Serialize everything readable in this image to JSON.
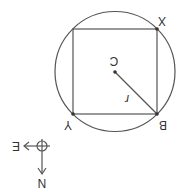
{
  "diagram": {
    "orientation": "rotated-180",
    "circle": {
      "cx": 115,
      "cy": 71.5,
      "r": 60,
      "stroke": "#555555"
    },
    "square": {
      "x": 73,
      "y": 29,
      "w": 84,
      "h": 85,
      "stroke": "#555555"
    },
    "center": {
      "x": 115,
      "y": 72,
      "label": "C"
    },
    "radius_line": {
      "x1": 115,
      "y1": 72,
      "x2": 157,
      "y2": 114,
      "label": "r"
    },
    "vertices": [
      {
        "name": "X",
        "x": 157,
        "y": 29,
        "label": "X"
      },
      {
        "name": "Y",
        "x": 73,
        "y": 114,
        "label": "Y"
      },
      {
        "name": "B",
        "x": 157,
        "y": 114,
        "label": "B"
      }
    ],
    "compass": {
      "east_label": "E",
      "north_label": "N"
    }
  }
}
